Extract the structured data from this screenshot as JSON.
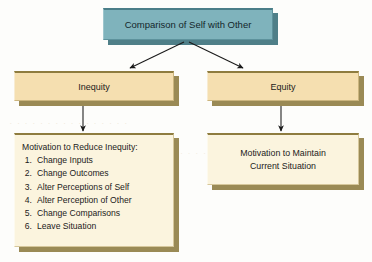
{
  "diagram": {
    "title_node": {
      "label": "Comparison of Self with Other"
    },
    "branches": [
      {
        "label": "Inequity"
      },
      {
        "label": "Equity"
      }
    ],
    "inequity_outcome": {
      "heading": "Motivation to Reduce Inequity:",
      "items": [
        {
          "num": "1.",
          "label": "Change Inputs"
        },
        {
          "num": "2.",
          "label": "Change Outcomes"
        },
        {
          "num": "3.",
          "label": "Alter Perceptions of Self"
        },
        {
          "num": "4.",
          "label": "Alter Perception of Other"
        },
        {
          "num": "5.",
          "label": "Change Comparisons"
        },
        {
          "num": "6.",
          "label": "Leave Situation"
        }
      ]
    },
    "equity_outcome": {
      "line1": "Motivation to Maintain",
      "line2": "Current Situation"
    },
    "watermark": {
      "a": "xpected Theor",
      "b": "· · · · · · · · · · · · · · · ·",
      "c": "· · · · · · · ·"
    },
    "colors": {
      "root_fill": "#7fb3bc",
      "branch_fill": "#f5dfb0",
      "leaf_fill": "#fbf4de",
      "shadow": "#9a8a55",
      "arrow": "#1a1a1a",
      "background": "#fdfdfb"
    }
  }
}
